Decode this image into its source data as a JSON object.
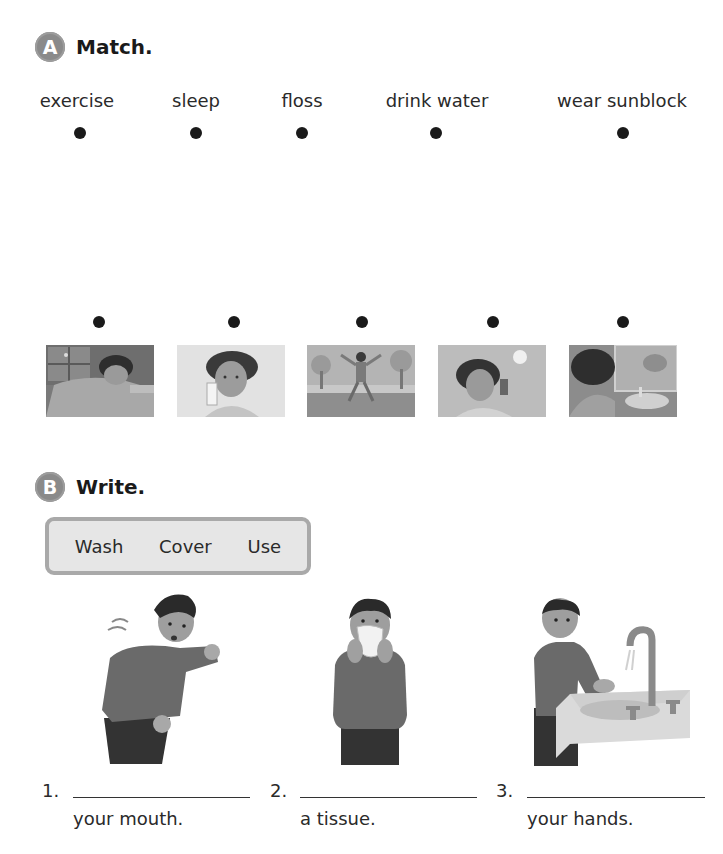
{
  "section_a": {
    "badge": "A",
    "title": "Match.",
    "words": [
      "exercise",
      "sleep",
      "floss",
      "drink water",
      "wear sunblock"
    ],
    "pictures": [
      {
        "name": "girl-sleeping-in-bed"
      },
      {
        "name": "girl-drinking-water"
      },
      {
        "name": "girl-jumping-exercise"
      },
      {
        "name": "girl-applying-sunblock"
      },
      {
        "name": "girl-flossing-at-mirror"
      }
    ]
  },
  "section_b": {
    "badge": "B",
    "title": "Write.",
    "word_bank": [
      "Wash",
      "Cover",
      "Use"
    ],
    "items": [
      {
        "number": "1.",
        "suffix": "your mouth.",
        "picture": "boy-coughing-into-elbow"
      },
      {
        "number": "2.",
        "suffix": "a tissue.",
        "picture": "boy-using-tissue"
      },
      {
        "number": "3.",
        "suffix": "your hands.",
        "picture": "boy-washing-hands"
      }
    ]
  }
}
